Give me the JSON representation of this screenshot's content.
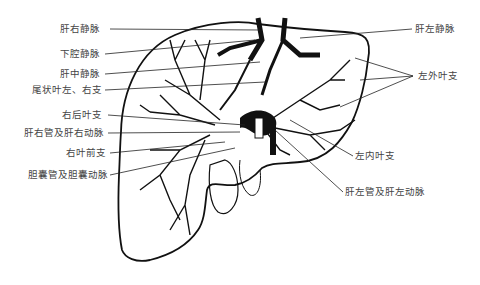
{
  "figure": {
    "labels_left": [
      {
        "id": "right-hepatic-vein",
        "text": "肝右静脉"
      },
      {
        "id": "inferior-vena-cava",
        "text": "下腔静脉"
      },
      {
        "id": "middle-hepatic-vein",
        "text": "肝中静脉"
      },
      {
        "id": "caudate-lobe-branches",
        "text": "尾状叶左、右支"
      },
      {
        "id": "right-posterior-branch",
        "text": "右后叶支"
      },
      {
        "id": "right-hepatic-duct-artery",
        "text": "肝右管及肝右动脉"
      },
      {
        "id": "right-anterior-branch",
        "text": "右叶前支"
      },
      {
        "id": "cystic-duct-artery",
        "text": "胆囊管及胆囊动脉"
      }
    ],
    "labels_right": [
      {
        "id": "left-hepatic-vein",
        "text": "肝左静脉"
      },
      {
        "id": "left-lateral-branch",
        "text": "左外叶支"
      },
      {
        "id": "left-medial-branch",
        "text": "左内叶支"
      },
      {
        "id": "left-hepatic-duct-artery",
        "text": "肝左管及肝左动脉"
      }
    ],
    "colors": {
      "ink": "#111111",
      "label": "#444444",
      "background": "#ffffff"
    }
  }
}
